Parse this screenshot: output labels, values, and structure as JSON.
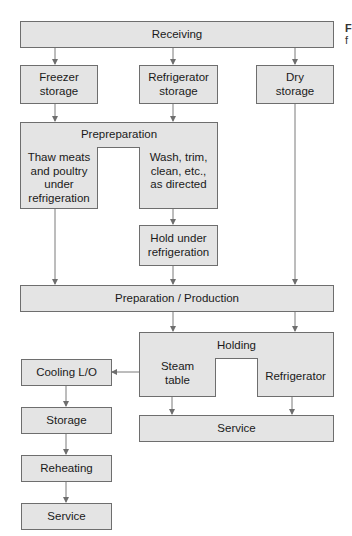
{
  "diagram": {
    "type": "flowchart",
    "style": {
      "box_fill": "#e4e4e4",
      "box_border": "#6e6e6e",
      "line_color": "#777777"
    },
    "nodes": {
      "receiving": "Receiving",
      "freezer_storage": "Freezer storage",
      "refrigerator_storage": "Refrigerator storage",
      "dry_storage": "Dry storage",
      "prepreparation": "Prepreparation",
      "thaw": "Thaw meats and poultry under refrigeration",
      "wash": "Wash, trim, clean, etc., as directed",
      "hold_under_refrigeration": "Hold under refrigeration",
      "preparation_production": "Preparation / Production",
      "holding": "Holding",
      "steam_table": "Steam table",
      "refrigerator": "Refrigerator",
      "service_main": "Service",
      "cooling": "Cooling L/O",
      "storage": "Storage",
      "reheating": "Reheating",
      "service_leftover": "Service"
    },
    "edges": [
      [
        "Receiving",
        "Freezer storage"
      ],
      [
        "Receiving",
        "Refrigerator storage"
      ],
      [
        "Receiving",
        "Dry storage"
      ],
      [
        "Freezer storage",
        "Prepreparation"
      ],
      [
        "Refrigerator storage",
        "Prepreparation"
      ],
      [
        "Wash, trim, clean, etc., as directed",
        "Hold under refrigeration"
      ],
      [
        "Thaw meats and poultry under refrigeration",
        "Preparation / Production"
      ],
      [
        "Hold under refrigeration",
        "Preparation / Production"
      ],
      [
        "Dry storage",
        "Preparation / Production"
      ],
      [
        "Preparation / Production",
        "Holding"
      ],
      [
        "Steam table",
        "Service"
      ],
      [
        "Refrigerator",
        "Service"
      ],
      [
        "Steam table",
        "Cooling L/O"
      ],
      [
        "Cooling L/O",
        "Storage"
      ],
      [
        "Storage",
        "Reheating"
      ],
      [
        "Reheating",
        "Service"
      ]
    ],
    "caption_fragment": {
      "line1": "F",
      "line2": "f"
    }
  }
}
